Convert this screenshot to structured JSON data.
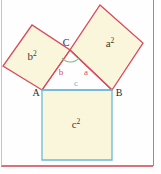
{
  "figure": {
    "colors": {
      "square_fill": "#faf6dc",
      "red_stroke": "#d9495c",
      "blue_stroke": "#6cb8dc",
      "green_stroke": "#7cb87c",
      "label_dark": "#3d3a35",
      "label_red": "#d9495c",
      "label_blue": "#6cb8dc",
      "page_border": "#d9707a",
      "background": "#fefefe"
    },
    "vertices": {
      "A": {
        "label": "A",
        "x": 42,
        "y": 90
      },
      "B": {
        "label": "B",
        "x": 112,
        "y": 90
      },
      "C": {
        "label": "C",
        "x": 70,
        "y": 50
      }
    },
    "squares": [
      {
        "name": "square-on-leg-b",
        "label": "b",
        "exponent": "2",
        "points": "42,90 70,50 32,25 3,66",
        "fill": "#faf6dc",
        "stroke": "#d9495c",
        "label_x": 32,
        "label_y": 60
      },
      {
        "name": "square-on-leg-a",
        "label": "a",
        "exponent": "2",
        "points": "70,50 112,90 143,43 100,5",
        "fill": "#faf6dc",
        "stroke": "#d9495c",
        "label_x": 110,
        "label_y": 47
      },
      {
        "name": "square-on-hypotenuse-c",
        "label": "c",
        "exponent": "2",
        "points": "42,90 112,90 112,160 42,160",
        "fill": "#faf6dc",
        "stroke": "#6cb8dc",
        "label_x": 76,
        "label_y": 128
      }
    ],
    "triangle": {
      "name": "right-triangle",
      "points": "42,90 112,90 70,50",
      "leg_b": {
        "label": "b",
        "x": 61,
        "y": 73,
        "color": "#d9495c"
      },
      "leg_a": {
        "label": "a",
        "x": 85,
        "y": 73,
        "color": "#d9495c"
      },
      "hypotenuse_c": {
        "label": "c",
        "x": 76,
        "y": 85,
        "color": "#6cb8dc"
      }
    },
    "right_angle_marker": {
      "name": "right-angle-arc",
      "path": "M 62,58 A 11 11 0 0 0 79,58",
      "stroke": "#7cb87c"
    },
    "page_borders": {
      "right_x": 153,
      "bottom_y": 165,
      "left_x": 1,
      "top_y": 0
    }
  }
}
